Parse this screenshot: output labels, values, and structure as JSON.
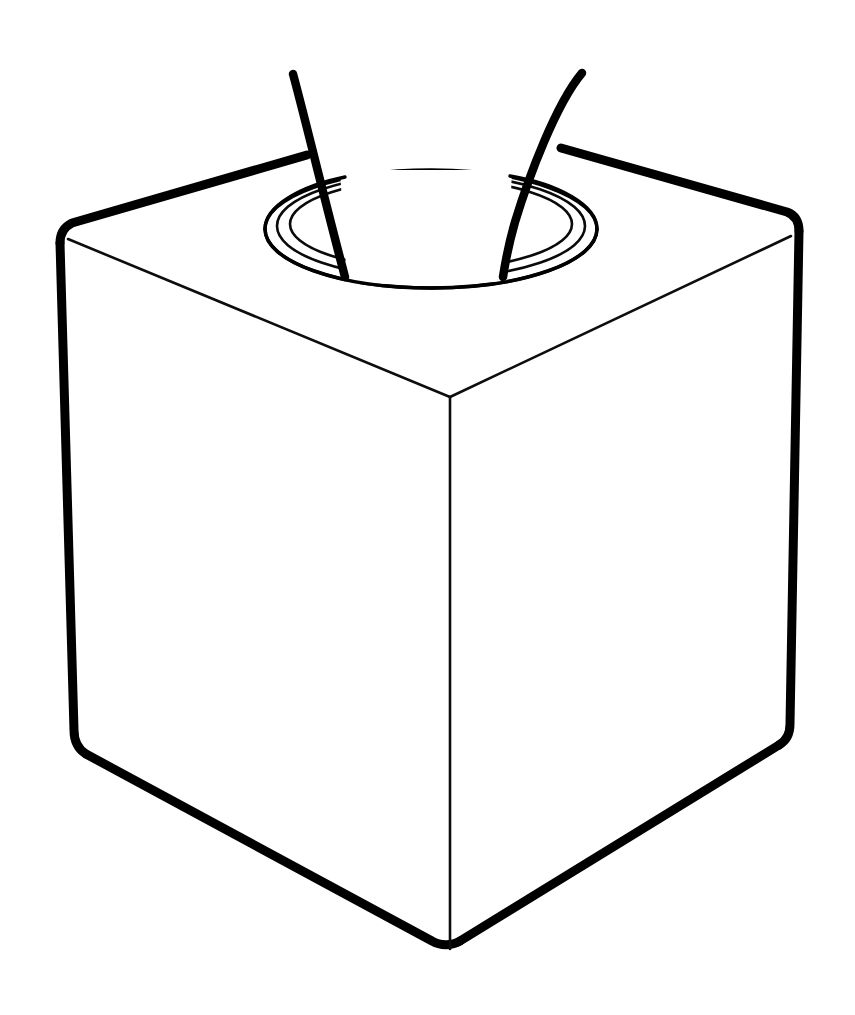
{
  "document": {
    "title": "Tissue Box Line Drawing",
    "style": "black-and-white outline illustration",
    "background_color": "#ffffff",
    "line_color": "#000000",
    "canvas": {
      "width": 855,
      "height": 1015
    }
  },
  "subject": {
    "name": "tissue box",
    "shape": "cube",
    "description": "A cube-shaped tissue box drawn in outline with an oval dispensing opening on the top face and two tissue sheets rising out of it."
  },
  "parts": {
    "top_face": {
      "label": "Top face",
      "vertices": "left (57,235), back (430,128), right (798,232), front (450,397)"
    },
    "left_face": {
      "label": "Front-left face",
      "vertices": "top-left (57,235), top-right (450,397), bottom-right (450,952), bottom-left (80,752)"
    },
    "right_face": {
      "label": "Front-right face",
      "vertices": "top-left (450,397), top-right (798,232), bottom-right (786,745), bottom-left (450,952)"
    },
    "opening": {
      "label": "Oval dispensing opening",
      "shape": "ellipse",
      "center_x": 431,
      "center_y": 229,
      "radius_x": 166,
      "radius_y": 59,
      "ring_count": 3
    },
    "tissue_left": {
      "label": "Left tissue sheet",
      "top_point": "(293,74)",
      "bottom_point": "(345,277)"
    },
    "tissue_right": {
      "label": "Right tissue sheet",
      "top_point": "(582,73)",
      "bottom_point": "(503,277)"
    }
  },
  "colors": {
    "paper": "#ffffff",
    "ink": "#000000"
  }
}
